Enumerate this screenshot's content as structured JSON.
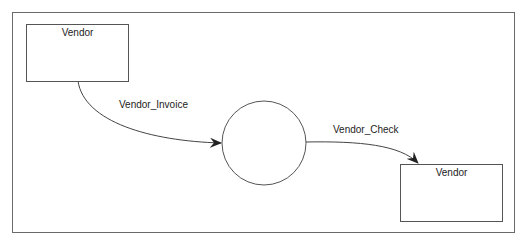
{
  "diagram": {
    "type": "data-flow-diagram",
    "entities": [
      {
        "id": "vendor-source",
        "label": "Vendor"
      },
      {
        "id": "vendor-sink",
        "label": "Vendor"
      }
    ],
    "process": {
      "label": ""
    },
    "flows": [
      {
        "label": "Vendor_Invoice",
        "from": "vendor-source",
        "to": "process"
      },
      {
        "label": "Vendor_Check",
        "from": "process",
        "to": "vendor-sink"
      }
    ],
    "colors": {
      "stroke": "#555555",
      "frame": "#6a6a6a",
      "background": "#ffffff"
    }
  }
}
